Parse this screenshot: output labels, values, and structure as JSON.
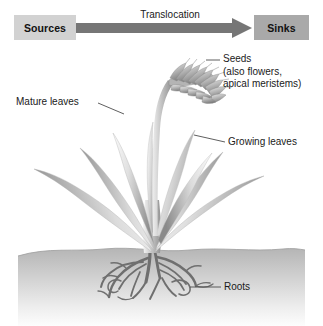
{
  "figure": {
    "width": 323,
    "height": 326,
    "background": "#ffffff"
  },
  "header": {
    "source_label": "Sources",
    "sink_label": "Sinks",
    "arrow_label": "Translocation",
    "source_box_color": "#d2d2d2",
    "sink_box_color": "#a9a9a9",
    "arrow_color": "#767676"
  },
  "callouts": [
    {
      "id": "seeds",
      "text": "Seeds\n(also flowers,\napical meristems)",
      "target": "seed-head"
    },
    {
      "id": "mature-leaves",
      "text": "Mature leaves",
      "target": "lower-left-leaf"
    },
    {
      "id": "growing-leaves",
      "text": "Growing leaves",
      "target": "upper-right-leaf"
    },
    {
      "id": "roots",
      "text": "Roots",
      "target": "root-system"
    }
  ],
  "plant": {
    "parts": [
      "seed-head",
      "flowering-stem",
      "mature-leaves",
      "growing-leaves",
      "leaf-sheath",
      "root-system"
    ],
    "leaf_fill_light": "#f2f2f2",
    "leaf_fill_dark": "#8f8f8f",
    "stem_color": "#9a9a9a",
    "root_color": "#6e6e6e"
  },
  "soil": {
    "top_color": "#b9b9b9",
    "bottom_color": "#fcfcfc",
    "top_y": 247
  },
  "leader_line_color": "#4d4d4d"
}
